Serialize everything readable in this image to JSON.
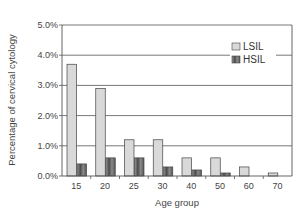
{
  "chart_data": {
    "type": "bar",
    "title": "",
    "xlabel": "Age group",
    "ylabel": "Percentage of cervical cytology",
    "categories": [
      "15",
      "20",
      "25",
      "30",
      "40",
      "50",
      "60",
      "70"
    ],
    "series": [
      {
        "name": "LSIL",
        "values": [
          3.7,
          2.9,
          1.2,
          1.2,
          0.6,
          0.6,
          0.3,
          0.1
        ],
        "color": "#d9d9d9"
      },
      {
        "name": "HSIL",
        "values": [
          0.4,
          0.6,
          0.6,
          0.3,
          0.2,
          0.1,
          0.0,
          0.0
        ],
        "color": "#6e6e6e"
      }
    ],
    "ylim": [
      0,
      5
    ],
    "yticks": [
      "0.0%",
      "1.0%",
      "2.0%",
      "3.0%",
      "4.0%",
      "5.0%"
    ],
    "grid": true,
    "legend_position": "upper right (inside)"
  }
}
